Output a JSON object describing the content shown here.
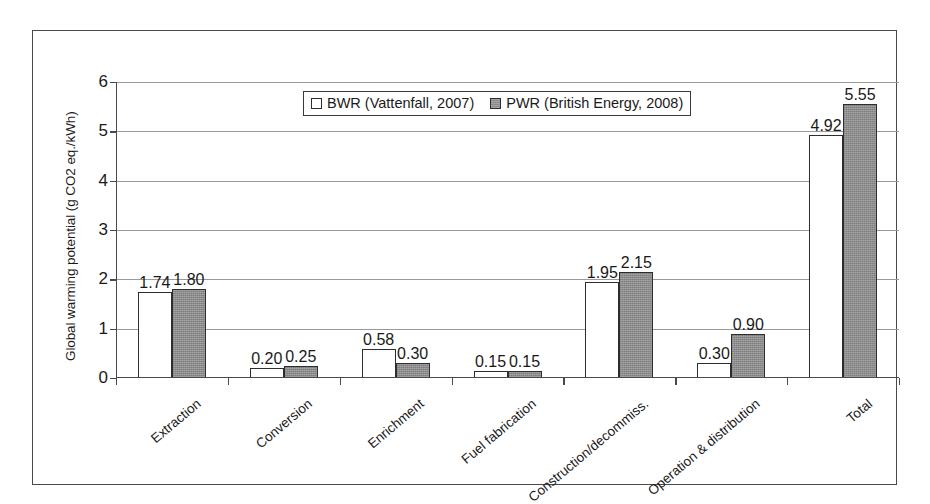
{
  "chart_data": {
    "type": "bar",
    "title": "",
    "xlabel": "",
    "ylabel": "Global warming potential (g CO2 eq./kWh)",
    "ylim": [
      0,
      6
    ],
    "ytick_values": [
      0,
      1,
      2,
      3,
      4,
      5,
      6
    ],
    "ytick_labels": [
      "0",
      "1",
      "2",
      "3",
      "4",
      "5",
      "6"
    ],
    "grid": true,
    "legend_position": "top-center",
    "categories": [
      "Extraction",
      "Conversion",
      "Enrichment",
      "Fuel fabrication",
      "Construction/decommiss.",
      "Operation & distribution",
      "Total"
    ],
    "series": [
      {
        "name": "BWR (Vattenfall, 2007)",
        "color": "#ffffff",
        "values": [
          1.74,
          0.2,
          0.58,
          0.15,
          1.95,
          0.3,
          4.92
        ],
        "labels": [
          "1.74",
          "0.20",
          "0.58",
          "0.15",
          "1.95",
          "0.30",
          "4.92"
        ]
      },
      {
        "name": "PWR (British Energy, 2008)",
        "color": "#8c8c8c",
        "values": [
          1.8,
          0.25,
          0.3,
          0.15,
          2.15,
          0.9,
          5.55
        ],
        "labels": [
          "1.80",
          "0.25",
          "0.30",
          "0.15",
          "2.15",
          "0.90",
          "5.55"
        ]
      }
    ]
  },
  "legend": {
    "entries": [
      {
        "label": "BWR (Vattenfall, 2007)",
        "swatch": "white-square-icon"
      },
      {
        "label": "PWR (British Energy, 2008)",
        "swatch": "gray-square-icon"
      }
    ]
  }
}
